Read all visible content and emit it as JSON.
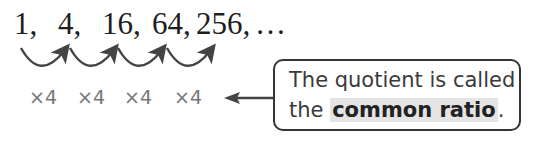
{
  "sequence": {
    "terms": [
      "1,",
      "4,",
      "16,",
      "64,",
      "256,",
      "…"
    ]
  },
  "multipliers": [
    "×4",
    "×4",
    "×4",
    "×4"
  ],
  "callout": {
    "line1": "The quotient is called",
    "line2_prefix": "the ",
    "highlight": "common ratio",
    "line2_suffix": "."
  },
  "colors": {
    "arc": "#444444",
    "multiplier": "#777777",
    "highlight_bg": "#e4e4e4",
    "border": "#333333"
  }
}
